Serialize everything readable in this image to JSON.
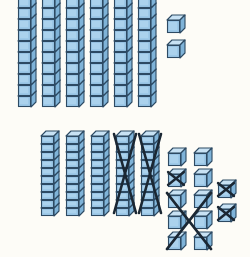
{
  "scene": {
    "title": "Base-ten blocks subtraction with regrouping",
    "background_color": "#fdfcf7",
    "block_colors": {
      "front_face": "#9dc9e8",
      "front_face_light": "#b6d8f0",
      "top_face": "#c8e2f4",
      "side_face": "#7fb3d8",
      "outline": "#2d4a63",
      "cross_out": "#1b2733"
    },
    "unit_cube_px": 17,
    "rod_cube_count": 10
  },
  "top_row": {
    "label": "minuend",
    "value": 62,
    "tens_rods": {
      "count": 6,
      "crossed_out": 0,
      "cubes_per_rod": 10,
      "start_x": 18,
      "spacing": 24,
      "top_y": -8
    },
    "ones_cubes": {
      "count": 2,
      "crossed_out": 0,
      "positions": [
        {
          "x": 167,
          "y": 15,
          "crossed": false
        },
        {
          "x": 167,
          "y": 40,
          "crossed": false
        }
      ]
    }
  },
  "bottom_row": {
    "label": "regrouped result",
    "tens_rods": {
      "count": 5,
      "crossed_out": 2,
      "cubes_per_rod": 10,
      "start_x": 41,
      "spacing": 25,
      "top_y": 131,
      "crossed_indices": [
        3,
        4
      ]
    },
    "ones_cluster": {
      "columns": 2,
      "rows": 5,
      "count": 10,
      "start_x": 168,
      "start_y": 148,
      "col_spacing": 26,
      "row_spacing": 21,
      "single_cross_cells": [
        [
          1,
          0
        ]
      ],
      "big_cross_rows": [
        2,
        3,
        4
      ]
    },
    "extra_ones": {
      "count": 2,
      "crossed_out": 2,
      "positions": [
        {
          "x": 218,
          "y": 180,
          "crossed": true
        },
        {
          "x": 218,
          "y": 204,
          "crossed": true
        }
      ]
    }
  }
}
